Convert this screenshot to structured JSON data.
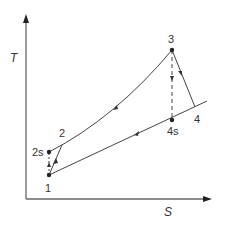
{
  "diagram": {
    "type": "T-S diagram (Brayton cycle)",
    "axes": {
      "y_label": "T",
      "x_label": "S"
    },
    "points": [
      {
        "id": "1",
        "label": "1"
      },
      {
        "id": "2s",
        "label": "2s"
      },
      {
        "id": "2",
        "label": "2"
      },
      {
        "id": "3",
        "label": "3"
      },
      {
        "id": "4s",
        "label": "4s"
      },
      {
        "id": "4",
        "label": "4"
      }
    ],
    "processes": [
      {
        "from": "1",
        "to": "2s",
        "style": "dashed",
        "meaning": "isentropic compression"
      },
      {
        "from": "1",
        "to": "2",
        "style": "solid",
        "meaning": "actual compression"
      },
      {
        "from": "2",
        "to": "3",
        "style": "solid",
        "meaning": "constant-pressure heat addition"
      },
      {
        "from": "3",
        "to": "4s",
        "style": "dashed",
        "meaning": "isentropic expansion"
      },
      {
        "from": "3",
        "to": "4",
        "style": "solid",
        "meaning": "actual expansion"
      },
      {
        "from": "4",
        "to": "1",
        "style": "solid",
        "meaning": "constant-pressure heat rejection"
      }
    ],
    "colors": {
      "line": "#444444",
      "axis": "#555555",
      "text": "#333333"
    }
  }
}
